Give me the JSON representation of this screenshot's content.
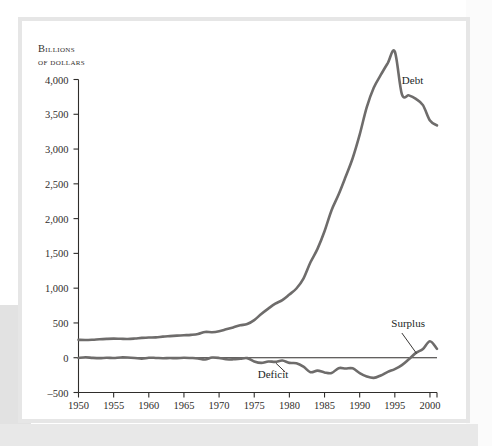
{
  "figure": {
    "axis_title_line1": "Billions",
    "axis_title_line2": "of dollars",
    "background_color": "#ffffff",
    "frame_color": "#e6e6e6",
    "line_color": "#6e6c6b",
    "axis_color": "#2f2d2b"
  },
  "chart_data": {
    "type": "line",
    "title": "",
    "subtitle": "",
    "xlabel": "",
    "ylabel": "Billions of dollars",
    "xlim": [
      1950,
      2001
    ],
    "ylim": [
      -500,
      4000
    ],
    "grid": false,
    "legend_position": "inline-annotations",
    "ytick_labels": [
      "4,000",
      "3,500",
      "3,000",
      "2,500",
      "2,000",
      "1,500",
      "1,000",
      "500",
      "0",
      "-500"
    ],
    "ytick_values": [
      4000,
      3500,
      3000,
      2500,
      2000,
      1500,
      1000,
      500,
      0,
      -500
    ],
    "xtick_labels": [
      "1950",
      "1955",
      "1960",
      "1965",
      "1970",
      "1975",
      "1980",
      "1985",
      "1990",
      "1995",
      "2000"
    ],
    "xtick_values": [
      1950,
      1955,
      1960,
      1965,
      1970,
      1975,
      1980,
      1985,
      1990,
      1995,
      2000
    ],
    "annotations": [
      {
        "text": "Debt",
        "x": 1996,
        "y": 3980,
        "leader": false
      },
      {
        "text": "Surplus",
        "x": 1994.5,
        "y": 480,
        "leader": true
      },
      {
        "text": "Deficit",
        "x": 1975.5,
        "y": -250,
        "leader": true
      }
    ],
    "series": [
      {
        "name": "Debt",
        "x": [
          1950,
          1951,
          1952,
          1953,
          1954,
          1955,
          1956,
          1957,
          1958,
          1959,
          1960,
          1961,
          1962,
          1963,
          1964,
          1965,
          1966,
          1967,
          1968,
          1969,
          1970,
          1971,
          1972,
          1973,
          1974,
          1975,
          1976,
          1977,
          1978,
          1979,
          1980,
          1981,
          1982,
          1983,
          1984,
          1985,
          1986,
          1987,
          1988,
          1989,
          1990,
          1991,
          1992,
          1993,
          1994,
          1995,
          1996,
          1997,
          1998,
          1999,
          2000,
          2001
        ],
        "values": [
          257,
          255,
          259,
          266,
          271,
          274,
          272,
          270,
          276,
          285,
          291,
          293,
          303,
          310,
          317,
          323,
          329,
          341,
          370,
          367,
          381,
          408,
          436,
          466,
          484,
          541,
          629,
          706,
          777,
          829,
          909,
          995,
          1137,
          1372,
          1565,
          1818,
          2121,
          2346,
          2601,
          2868,
          3207,
          3599,
          3881,
          4065,
          4236,
          4401,
          3790,
          3772,
          3721,
          3632,
          3410,
          3340
        ]
      },
      {
        "name": "Deficit/Surplus",
        "x": [
          1950,
          1951,
          1952,
          1953,
          1954,
          1955,
          1956,
          1957,
          1958,
          1959,
          1960,
          1961,
          1962,
          1963,
          1964,
          1965,
          1966,
          1967,
          1968,
          1969,
          1970,
          1971,
          1972,
          1973,
          1974,
          1975,
          1976,
          1977,
          1978,
          1979,
          1980,
          1981,
          1982,
          1983,
          1984,
          1985,
          1986,
          1987,
          1988,
          1989,
          1990,
          1991,
          1992,
          1993,
          1994,
          1995,
          1996,
          1997,
          1998,
          1999,
          2000,
          2001
        ],
        "values": [
          -3,
          6,
          -2,
          -6,
          -1,
          -3,
          4,
          3,
          -3,
          -13,
          0,
          -3,
          -7,
          -5,
          -6,
          -1,
          -4,
          -9,
          -25,
          3,
          -3,
          -23,
          -23,
          -15,
          -6,
          -53,
          -74,
          -54,
          -59,
          -41,
          -74,
          -79,
          -128,
          -208,
          -185,
          -212,
          -221,
          -150,
          -155,
          -153,
          -221,
          -269,
          -290,
          -255,
          -203,
          -164,
          -107,
          -22,
          69,
          126,
          236,
          127
        ]
      }
    ]
  }
}
